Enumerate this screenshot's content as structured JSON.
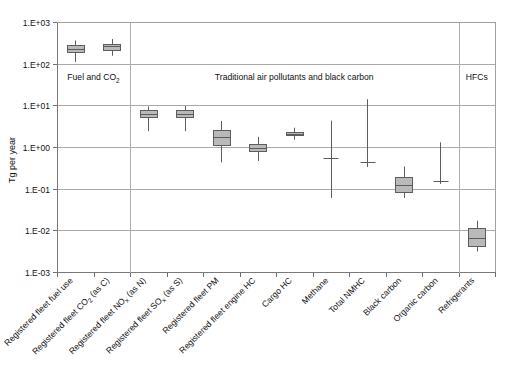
{
  "chart_data": {
    "type": "bar",
    "plot_style": "box-and-whisker (log scale)",
    "title": "",
    "xlabel": "",
    "ylabel": "Tg per year",
    "yscale": "log",
    "ylim": [
      0.001,
      1000
    ],
    "ytick_labels": [
      "1.E+03",
      "1.E+02",
      "1.E+01",
      "1.E+00",
      "1.E-01",
      "1.E-02",
      "1.E-03"
    ],
    "ytick_values": [
      1000,
      100,
      10,
      1,
      0.1,
      0.01,
      0.001
    ],
    "grid": true,
    "legend": "none",
    "categories": [
      "Registered fleet fuel use",
      "Registered fleet CO2 (as C)",
      "Registered fleet NOx (as N)",
      "Registered fleet SOx (as S)",
      "Registered fleet PM",
      "Registered fleet engine HC",
      "Cargo HC",
      "Methane",
      "Total NMHC",
      "Black carbon",
      "Organic carbon",
      "Refrigerants"
    ],
    "category_labels_rich": [
      {
        "main": "Registered fleet fuel use",
        "sub": "",
        "tail": ""
      },
      {
        "main": "Registered fleet CO",
        "sub": "2",
        "tail": " (as C)"
      },
      {
        "main": "Registered fleet NO",
        "sub": "x",
        "tail": " (as N)"
      },
      {
        "main": "Registered fleet SO",
        "sub": "x",
        "tail": " (as S)"
      },
      {
        "main": "Registered fleet PM",
        "sub": "",
        "tail": ""
      },
      {
        "main": "Registered fleet engine HC",
        "sub": "",
        "tail": ""
      },
      {
        "main": "Cargo HC",
        "sub": "",
        "tail": ""
      },
      {
        "main": "Methane",
        "sub": "",
        "tail": ""
      },
      {
        "main": "Total NMHC",
        "sub": "",
        "tail": ""
      },
      {
        "main": "Black carbon",
        "sub": "",
        "tail": ""
      },
      {
        "main": "Organic carbon",
        "sub": "",
        "tail": ""
      },
      {
        "main": "Refrigerants",
        "sub": "",
        "tail": ""
      }
    ],
    "series": [
      {
        "name": "Registered fleet fuel use",
        "low": 110.0,
        "q1": 190.0,
        "median": 230.0,
        "q3": 280.0,
        "high": 360.0,
        "has_box": true
      },
      {
        "name": "Registered fleet CO2 (as C)",
        "low": 155.0,
        "q1": 220.0,
        "median": 260.0,
        "q3": 300.0,
        "high": 390.0,
        "has_box": true
      },
      {
        "name": "Registered fleet NOx (as N)",
        "low": 2.4,
        "q1": 5.1,
        "median": 6.2,
        "q3": 7.6,
        "high": 9.4,
        "has_box": true
      },
      {
        "name": "Registered fleet SOx (as S)",
        "low": 2.4,
        "q1": 5.1,
        "median": 6.2,
        "q3": 7.6,
        "high": 9.6,
        "has_box": true
      },
      {
        "name": "Registered fleet PM",
        "low": 0.43,
        "q1": 1.15,
        "median": 1.7,
        "q3": 2.6,
        "high": 4.2,
        "has_box": true
      },
      {
        "name": "Registered fleet engine HC",
        "low": 0.46,
        "q1": 0.8,
        "median": 0.95,
        "q3": 1.2,
        "high": 1.75,
        "has_box": true
      },
      {
        "name": "Cargo HC",
        "low": 1.5,
        "q1": 1.95,
        "median": 2.1,
        "q3": 2.3,
        "high": 2.9,
        "has_box": true
      },
      {
        "name": "Methane",
        "low": 0.06,
        "median": 0.55,
        "high": 4.3,
        "has_box": false
      },
      {
        "name": "Total NMHC",
        "low": 0.33,
        "median": 0.43,
        "high": 14.0,
        "has_box": false
      },
      {
        "name": "Black carbon",
        "low": 0.06,
        "q1": 0.085,
        "median": 0.12,
        "q3": 0.19,
        "high": 0.34,
        "has_box": true
      },
      {
        "name": "Organic carbon",
        "low": 0.13,
        "median": 0.155,
        "high": 1.3,
        "has_box": false
      },
      {
        "name": "Refrigerants",
        "low": 0.0031,
        "q1": 0.0043,
        "median": 0.0065,
        "q3": 0.0115,
        "high": 0.017,
        "has_box": true
      }
    ],
    "annotations": [
      {
        "text": "Fuel and CO2",
        "text_main": "Fuel and CO",
        "text_sub": "2",
        "group_start": 0,
        "group_end": 1
      },
      {
        "text": "Traditional air pollutants and black carbon",
        "text_main": "Traditional air pollutants and black carbon",
        "text_sub": "",
        "group_start": 2,
        "group_end": 10
      },
      {
        "text": "HFCs",
        "text_main": "HFCs",
        "text_sub": "",
        "group_start": 11,
        "group_end": 11
      }
    ],
    "group_dividers": [
      2,
      11
    ]
  }
}
